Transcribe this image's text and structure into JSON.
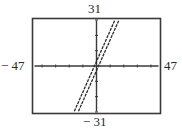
{
  "chart_data": {
    "type": "line",
    "title": "",
    "xlabel": "",
    "ylabel": "",
    "xlim": [
      -47,
      47
    ],
    "ylim": [
      -31,
      31
    ],
    "x_tick_step": 10,
    "y_tick_step": 10,
    "grid": false,
    "legend": null,
    "window_labels": {
      "xmin": "− 47",
      "xmax": "47",
      "ymin": "− 31",
      "ymax": "31"
    },
    "series": [
      {
        "name": "y = 2x + 3",
        "slope": 2,
        "intercept": 3,
        "x": [
          -17,
          14
        ],
        "y": [
          -31,
          31
        ]
      },
      {
        "name": "y = 2x − 3",
        "slope": 2,
        "intercept": -3,
        "x": [
          -14,
          17
        ],
        "y": [
          -31,
          31
        ]
      }
    ]
  },
  "colors": {
    "frame": "#3a3a3a",
    "axes": "#3a3a3a",
    "lines": "#2a2a2a",
    "background": "#ffffff"
  }
}
